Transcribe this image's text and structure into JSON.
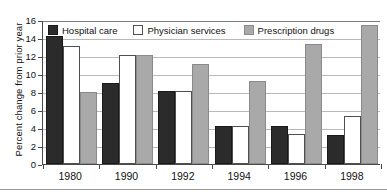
{
  "chart_data": {
    "type": "bar",
    "title": "",
    "xlabel": "",
    "ylabel": "Percent change from prior year",
    "categories": [
      "1980",
      "1990",
      "1992",
      "1994",
      "1996",
      "1998"
    ],
    "series": [
      {
        "name": "Hospital care",
        "color": "#2b2b2b",
        "values": [
          14.2,
          9.0,
          8.1,
          4.2,
          4.2,
          3.2
        ]
      },
      {
        "name": "Physician services",
        "color": "#ffffff",
        "values": [
          13.1,
          12.1,
          8.1,
          4.2,
          3.3,
          5.3
        ]
      },
      {
        "name": "Prescription drugs",
        "color": "#a9a9a9",
        "values": [
          8.0,
          12.1,
          11.1,
          9.2,
          13.3,
          15.4
        ]
      }
    ],
    "ylim": [
      0,
      16
    ],
    "yticks": [
      0,
      2,
      4,
      6,
      8,
      10,
      12,
      14,
      16
    ],
    "ytick_labels": [
      "0",
      "2",
      "4",
      "6",
      "8",
      "10",
      "12",
      "14",
      "16"
    ],
    "grid": true,
    "grid_axis": "y",
    "legend_position": "top-inside",
    "legend": [
      "Hospital care",
      "Physician services",
      "Prescription drugs"
    ]
  }
}
